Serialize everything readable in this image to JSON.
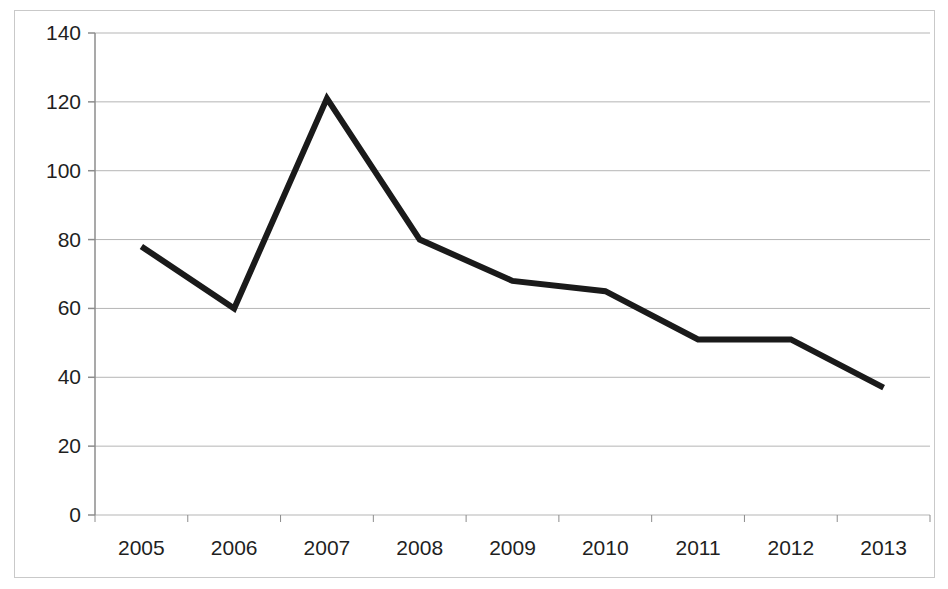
{
  "chart_data": {
    "type": "line",
    "title": "",
    "subtitle": "",
    "xlabel": "",
    "ylabel": "",
    "categories": [
      "2005",
      "2006",
      "2007",
      "2008",
      "2009",
      "2010",
      "2011",
      "2012",
      "2013"
    ],
    "values": [
      78,
      60,
      121,
      80,
      68,
      65,
      51,
      51,
      37
    ],
    "series": [
      {
        "name": "",
        "values": [
          78,
          60,
          121,
          80,
          68,
          65,
          51,
          51,
          37
        ],
        "color": "#1a1a1a",
        "line_width": 6,
        "markers": "none"
      }
    ],
    "ylim": [
      0,
      140
    ],
    "ytick_step": 20,
    "ytick_labels": [
      "0",
      "20",
      "40",
      "60",
      "80",
      "100",
      "120",
      "140"
    ],
    "ytick_values": [
      0,
      20,
      40,
      60,
      80,
      100,
      120,
      140
    ],
    "xtick_labels": [
      "2005",
      "2006",
      "2007",
      "2008",
      "2009",
      "2010",
      "2011",
      "2012",
      "2013"
    ],
    "grid": {
      "horizontal": true,
      "vertical": false,
      "color": "#b5b5b5"
    },
    "legend": {
      "visible": false,
      "position": "none",
      "entries": []
    },
    "axis": {
      "y_axis_line_color": "#8c8c8c",
      "x_axis_line_color": "#8c8c8c",
      "tick_marks": true
    },
    "frame": {
      "border_color": "#c9c9c9",
      "background": "#ffffff"
    },
    "annotations": []
  }
}
